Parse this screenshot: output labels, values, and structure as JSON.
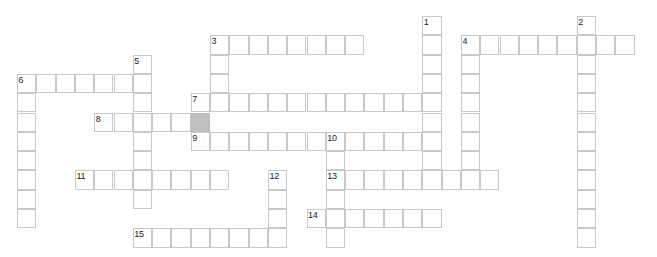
{
  "puzzle": {
    "type": "crossword-grid",
    "width_px": 657,
    "height_px": 257,
    "cell_size_px": 19.3,
    "origin_x_px": 17,
    "origin_y_px": 16,
    "background_color": "#ffffff",
    "cell_border_color": "#c8c8c8",
    "shaded_cell_color": "#bfbfbf",
    "number_color": "#1a1a1a",
    "entries": [
      {
        "number": "1",
        "direction": "down",
        "col": 21,
        "row": 0,
        "length": 9
      },
      {
        "number": "2",
        "direction": "down",
        "col": 29,
        "row": 0,
        "length": 12
      },
      {
        "number": "3",
        "direction": "across",
        "col": 10,
        "row": 1,
        "length": 8
      },
      {
        "number": "3",
        "direction": "down",
        "col": 10,
        "row": 1,
        "length": 4
      },
      {
        "number": "4",
        "direction": "across",
        "col": 23,
        "row": 1,
        "length": 9
      },
      {
        "number": "4",
        "direction": "down",
        "col": 23,
        "row": 1,
        "length": 8
      },
      {
        "number": "5",
        "direction": "down",
        "col": 6,
        "row": 2,
        "length": 8
      },
      {
        "number": "6",
        "direction": "across",
        "col": 0,
        "row": 3,
        "length": 6
      },
      {
        "number": "6",
        "direction": "down",
        "col": 0,
        "row": 3,
        "length": 8
      },
      {
        "number": "7",
        "direction": "across",
        "col": 9,
        "row": 4,
        "length": 13
      },
      {
        "number": "7",
        "direction": "down",
        "col": 9,
        "row": 4,
        "length": 2
      },
      {
        "number": "8",
        "direction": "across",
        "col": 4,
        "row": 5,
        "length": 6
      },
      {
        "number": "9",
        "direction": "across",
        "col": 9,
        "row": 6,
        "length": 13
      },
      {
        "number": "10",
        "direction": "across",
        "col": 16,
        "row": 6,
        "length": 6
      },
      {
        "number": "10",
        "direction": "down",
        "col": 16,
        "row": 6,
        "length": 4
      },
      {
        "number": "11",
        "direction": "across",
        "col": 3,
        "row": 8,
        "length": 8
      },
      {
        "number": "12",
        "direction": "down",
        "col": 13,
        "row": 8,
        "length": 4
      },
      {
        "number": "13",
        "direction": "across",
        "col": 16,
        "row": 8,
        "length": 9
      },
      {
        "number": "13",
        "direction": "down",
        "col": 16,
        "row": 8,
        "length": 4
      },
      {
        "number": "14",
        "direction": "across",
        "col": 15,
        "row": 10,
        "length": 7
      },
      {
        "number": "15",
        "direction": "across",
        "col": 6,
        "row": 11,
        "length": 8
      }
    ],
    "cells": [
      [
        21,
        0
      ],
      [
        29,
        0
      ],
      [
        21,
        1
      ],
      [
        29,
        1
      ],
      [
        10,
        1
      ],
      [
        11,
        1
      ],
      [
        12,
        1
      ],
      [
        13,
        1
      ],
      [
        14,
        1
      ],
      [
        15,
        1
      ],
      [
        16,
        1
      ],
      [
        17,
        1
      ],
      [
        23,
        1
      ],
      [
        24,
        1
      ],
      [
        25,
        1
      ],
      [
        26,
        1
      ],
      [
        27,
        1
      ],
      [
        28,
        1
      ],
      [
        29,
        1
      ],
      [
        30,
        1
      ],
      [
        31,
        1
      ],
      [
        10,
        2
      ],
      [
        21,
        2
      ],
      [
        23,
        2
      ],
      [
        29,
        2
      ],
      [
        6,
        2
      ],
      [
        10,
        3
      ],
      [
        21,
        3
      ],
      [
        23,
        3
      ],
      [
        29,
        3
      ],
      [
        0,
        3
      ],
      [
        1,
        3
      ],
      [
        2,
        3
      ],
      [
        3,
        3
      ],
      [
        4,
        3
      ],
      [
        5,
        3
      ],
      [
        6,
        3
      ],
      [
        0,
        4
      ],
      [
        21,
        4
      ],
      [
        23,
        4
      ],
      [
        29,
        4
      ],
      [
        6,
        4
      ],
      [
        9,
        4
      ],
      [
        10,
        4
      ],
      [
        11,
        4
      ],
      [
        12,
        4
      ],
      [
        13,
        4
      ],
      [
        14,
        4
      ],
      [
        15,
        4
      ],
      [
        16,
        4
      ],
      [
        17,
        4
      ],
      [
        18,
        4
      ],
      [
        19,
        4
      ],
      [
        20,
        4
      ],
      [
        21,
        4
      ],
      [
        0,
        5
      ],
      [
        23,
        5
      ],
      [
        29,
        5
      ],
      [
        6,
        5
      ],
      [
        9,
        5
      ],
      [
        4,
        5
      ],
      [
        5,
        5
      ],
      [
        6,
        5
      ],
      [
        7,
        5
      ],
      [
        8,
        5
      ],
      [
        9,
        5
      ],
      [
        0,
        6
      ],
      [
        23,
        6
      ],
      [
        29,
        6
      ],
      [
        6,
        6
      ],
      [
        9,
        6
      ],
      [
        10,
        6
      ],
      [
        11,
        6
      ],
      [
        12,
        6
      ],
      [
        13,
        6
      ],
      [
        14,
        6
      ],
      [
        15,
        6
      ],
      [
        16,
        6
      ],
      [
        17,
        6
      ],
      [
        18,
        6
      ],
      [
        19,
        6
      ],
      [
        20,
        6
      ],
      [
        21,
        6
      ],
      [
        0,
        7
      ],
      [
        23,
        7
      ],
      [
        29,
        7
      ],
      [
        6,
        7
      ],
      [
        16,
        7
      ],
      [
        0,
        8
      ],
      [
        23,
        8
      ],
      [
        29,
        8
      ],
      [
        6,
        8
      ],
      [
        16,
        8
      ],
      [
        13,
        8
      ],
      [
        3,
        8
      ],
      [
        4,
        8
      ],
      [
        5,
        8
      ],
      [
        6,
        8
      ],
      [
        7,
        8
      ],
      [
        8,
        8
      ],
      [
        9,
        8
      ],
      [
        10,
        8
      ],
      [
        16,
        8
      ],
      [
        17,
        8
      ],
      [
        18,
        8
      ],
      [
        19,
        8
      ],
      [
        20,
        8
      ],
      [
        21,
        8
      ],
      [
        22,
        8
      ],
      [
        23,
        8
      ],
      [
        24,
        8
      ],
      [
        0,
        9
      ],
      [
        29,
        9
      ],
      [
        6,
        9
      ],
      [
        16,
        9
      ],
      [
        13,
        9
      ],
      [
        0,
        10
      ],
      [
        29,
        10
      ],
      [
        16,
        10
      ],
      [
        13,
        10
      ],
      [
        15,
        10
      ],
      [
        16,
        10
      ],
      [
        17,
        10
      ],
      [
        18,
        10
      ],
      [
        19,
        10
      ],
      [
        20,
        10
      ],
      [
        21,
        10
      ],
      [
        29,
        11
      ],
      [
        16,
        11
      ],
      [
        13,
        11
      ],
      [
        6,
        11
      ],
      [
        7,
        11
      ],
      [
        8,
        11
      ],
      [
        9,
        11
      ],
      [
        10,
        11
      ],
      [
        11,
        11
      ],
      [
        12,
        11
      ],
      [
        13,
        11
      ]
    ],
    "shaded_cells": [
      [
        9,
        5
      ]
    ]
  }
}
